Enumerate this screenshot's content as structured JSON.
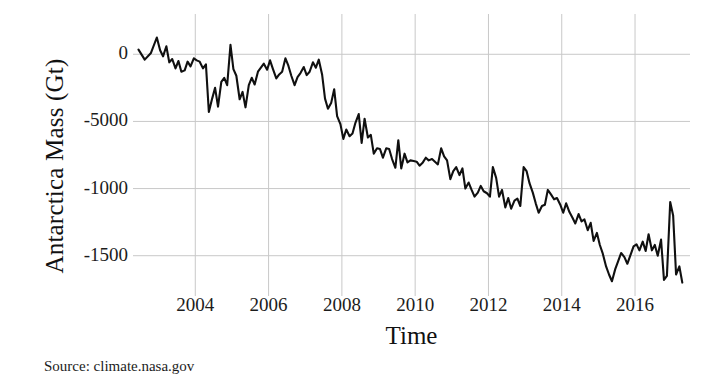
{
  "figure": {
    "background_color": "#ffffff",
    "source_caption": "Source: climate.nasa.gov"
  },
  "chart_data": {
    "type": "line",
    "title": "",
    "xlabel": "Time",
    "ylabel": "Antarctica Mass (Gt)",
    "line_color": "#101010",
    "grid_color": "#c8c8c8",
    "grid": true,
    "legend": "none",
    "xlim": [
      2002.3,
      2017.5
    ],
    "ylim": [
      -1800,
      300
    ],
    "xticks": [
      2004,
      2006,
      2008,
      2010,
      2012,
      2014,
      2016
    ],
    "xtick_labels": [
      "2004",
      "2006",
      "2008",
      "2010",
      "2012",
      "2014",
      "2016"
    ],
    "yticks": [
      0,
      -500,
      -1000,
      -1500
    ],
    "ytick_labels": [
      "0",
      "-5000",
      "-1000",
      "-1500"
    ],
    "series": [
      {
        "name": "Antarctica ice mass anomaly",
        "units": "Gt",
        "x": [
          2002.45,
          2002.62,
          2002.79,
          2002.95,
          2003.04,
          2003.12,
          2003.21,
          2003.29,
          2003.37,
          2003.46,
          2003.54,
          2003.62,
          2003.71,
          2003.79,
          2003.87,
          2003.96,
          2004.04,
          2004.12,
          2004.21,
          2004.29,
          2004.37,
          2004.46,
          2004.54,
          2004.62,
          2004.71,
          2004.79,
          2004.87,
          2004.96,
          2005.04,
          2005.12,
          2005.21,
          2005.29,
          2005.37,
          2005.46,
          2005.54,
          2005.62,
          2005.71,
          2005.79,
          2005.87,
          2005.96,
          2006.04,
          2006.12,
          2006.21,
          2006.29,
          2006.37,
          2006.46,
          2006.54,
          2006.62,
          2006.71,
          2006.79,
          2006.87,
          2006.96,
          2007.04,
          2007.12,
          2007.21,
          2007.29,
          2007.37,
          2007.46,
          2007.54,
          2007.62,
          2007.71,
          2007.79,
          2007.87,
          2007.96,
          2008.04,
          2008.12,
          2008.21,
          2008.29,
          2008.37,
          2008.46,
          2008.54,
          2008.62,
          2008.71,
          2008.79,
          2008.87,
          2008.96,
          2009.04,
          2009.12,
          2009.21,
          2009.29,
          2009.37,
          2009.46,
          2009.54,
          2009.62,
          2009.71,
          2009.79,
          2009.87,
          2009.96,
          2010.04,
          2010.12,
          2010.21,
          2010.29,
          2010.37,
          2010.46,
          2010.54,
          2010.62,
          2010.71,
          2010.79,
          2010.87,
          2010.96,
          2011.04,
          2011.12,
          2011.21,
          2011.29,
          2011.37,
          2011.46,
          2011.54,
          2011.62,
          2011.71,
          2011.79,
          2011.87,
          2011.96,
          2012.04,
          2012.12,
          2012.21,
          2012.29,
          2012.37,
          2012.46,
          2012.54,
          2012.62,
          2012.71,
          2012.79,
          2012.87,
          2012.96,
          2013.04,
          2013.12,
          2013.21,
          2013.29,
          2013.37,
          2013.46,
          2013.54,
          2013.62,
          2013.71,
          2013.79,
          2013.87,
          2013.96,
          2014.04,
          2014.12,
          2014.21,
          2014.29,
          2014.37,
          2014.46,
          2014.54,
          2014.62,
          2014.71,
          2014.79,
          2014.87,
          2014.96,
          2015.04,
          2015.12,
          2015.21,
          2015.29,
          2015.37,
          2015.46,
          2015.54,
          2015.62,
          2015.71,
          2015.79,
          2015.87,
          2015.96,
          2016.04,
          2016.12,
          2016.21,
          2016.29,
          2016.37,
          2016.46,
          2016.54,
          2016.62,
          2016.71,
          2016.79,
          2016.87,
          2016.96,
          2017.04,
          2017.12,
          2017.21,
          2017.29
        ],
        "y": [
          35,
          -40,
          10,
          125,
          30,
          -15,
          60,
          -60,
          -35,
          -105,
          -50,
          -130,
          -120,
          -55,
          -90,
          -30,
          -45,
          -55,
          -105,
          -75,
          -430,
          -330,
          -250,
          -390,
          -205,
          -175,
          -230,
          70,
          -110,
          -160,
          -335,
          -280,
          -395,
          -230,
          -175,
          -225,
          -130,
          -100,
          -70,
          -115,
          -45,
          -110,
          -180,
          -150,
          -130,
          -30,
          -85,
          -160,
          -230,
          -170,
          -140,
          -95,
          -155,
          -130,
          -60,
          -100,
          -40,
          -150,
          -330,
          -405,
          -360,
          -260,
          -460,
          -520,
          -630,
          -560,
          -610,
          -590,
          -510,
          -445,
          -660,
          -480,
          -620,
          -600,
          -740,
          -700,
          -705,
          -770,
          -700,
          -705,
          -780,
          -845,
          -640,
          -850,
          -740,
          -805,
          -790,
          -795,
          -800,
          -830,
          -805,
          -770,
          -790,
          -780,
          -800,
          -820,
          -700,
          -760,
          -790,
          -930,
          -870,
          -840,
          -900,
          -850,
          -1000,
          -955,
          -1010,
          -1060,
          -1030,
          -980,
          -1020,
          -1035,
          -1060,
          -840,
          -920,
          -1060,
          -1010,
          -1140,
          -1070,
          -1150,
          -1090,
          -1075,
          -1130,
          -840,
          -870,
          -960,
          -1030,
          -1110,
          -1180,
          -1130,
          -1120,
          -1010,
          -1045,
          -1080,
          -1070,
          -1120,
          -1180,
          -1110,
          -1175,
          -1215,
          -1260,
          -1190,
          -1245,
          -1230,
          -1310,
          -1255,
          -1390,
          -1330,
          -1420,
          -1485,
          -1580,
          -1640,
          -1690,
          -1600,
          -1540,
          -1480,
          -1510,
          -1560,
          -1500,
          -1430,
          -1415,
          -1460,
          -1395,
          -1465,
          -1340,
          -1460,
          -1420,
          -1500,
          -1380,
          -1680,
          -1650,
          -1100,
          -1200,
          -1640,
          -1580,
          -1700
        ]
      }
    ]
  },
  "axes": {
    "y_ticks": [
      {
        "label": "0",
        "pos_pct": 12.06
      },
      {
        "label": "-5000",
        "pos_pct": 36.88
      },
      {
        "label": "-1000",
        "pos_pct": 59.93
      },
      {
        "label": "-1500",
        "pos_pct": 84.75
      }
    ],
    "x_ticks": [
      {
        "label": "2004",
        "pos_px": 200
      },
      {
        "label": "2006",
        "pos_px": 264
      },
      {
        "label": "2008",
        "pos_px": 329
      },
      {
        "label": "2010",
        "pos_px": 393
      },
      {
        "label": "2012",
        "pos_px": 458
      },
      {
        "label": "2014",
        "pos_px": 522
      },
      {
        "label": "2016",
        "pos_px": 587
      }
    ]
  }
}
